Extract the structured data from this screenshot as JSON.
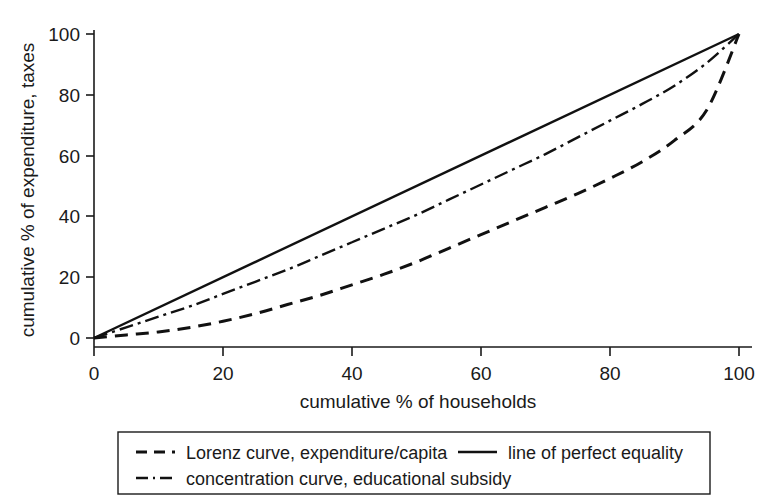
{
  "chart_data": {
    "type": "line",
    "title": "",
    "xlabel": "cumulative % of households",
    "ylabel": "cumulative % of expenditure, taxes",
    "xlim": [
      0,
      100
    ],
    "ylim": [
      0,
      100
    ],
    "xticks": [
      0,
      20,
      40,
      60,
      80,
      100
    ],
    "yticks": [
      0,
      20,
      40,
      60,
      80,
      100
    ],
    "grid": false,
    "legend_position": "below-plot",
    "x": [
      0,
      5,
      10,
      15,
      20,
      25,
      30,
      35,
      40,
      45,
      50,
      55,
      60,
      65,
      70,
      75,
      80,
      85,
      90,
      95,
      100
    ],
    "series": [
      {
        "name": "line of perfect equality",
        "style": "solid",
        "values": [
          0,
          5,
          10,
          15,
          20,
          25,
          30,
          35,
          40,
          45,
          50,
          55,
          60,
          65,
          70,
          75,
          80,
          85,
          90,
          95,
          100
        ]
      },
      {
        "name": "concentration curve, educational subsidy",
        "style": "dash-dot",
        "values": [
          0,
          3.5,
          7,
          10.5,
          14.5,
          18.5,
          22.5,
          27,
          31.5,
          36,
          40.5,
          45.5,
          50.5,
          55.5,
          60.5,
          66,
          71.5,
          77,
          83,
          90.5,
          100
        ]
      },
      {
        "name": "Lorenz curve, expenditure/capita",
        "style": "dashed",
        "values": [
          0,
          1,
          2,
          3.5,
          5.5,
          8,
          11,
          14,
          17.5,
          21,
          25,
          29.5,
          34,
          38.5,
          43,
          47.5,
          52.5,
          58,
          65,
          75,
          100
        ]
      }
    ],
    "legend": [
      {
        "label": "Lorenz curve, expenditure/capita",
        "style": "dashed"
      },
      {
        "label": "line of perfect equality",
        "style": "solid"
      },
      {
        "label": "concentration curve, educational subsidy",
        "style": "dash-dot"
      }
    ]
  },
  "axes": {
    "x_tick_labels": [
      "0",
      "20",
      "40",
      "60",
      "80",
      "100"
    ],
    "y_tick_labels": [
      "0",
      "20",
      "40",
      "60",
      "80",
      "100"
    ],
    "x_title": "cumulative % of households",
    "y_title": "cumulative % of expenditure, taxes"
  },
  "legend": {
    "item_lorenz": "Lorenz curve, expenditure/capita",
    "item_equality": "line of perfect equality",
    "item_concentration": "concentration curve, educational subsidy"
  },
  "colors": {
    "ink": "#1a1a1a",
    "line": "#111111",
    "background": "#ffffff"
  }
}
